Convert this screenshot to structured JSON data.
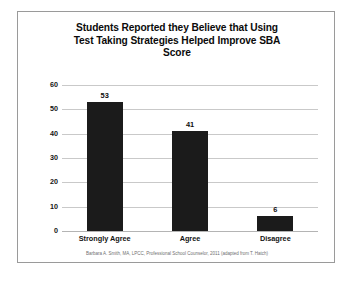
{
  "chart_data": {
    "type": "bar",
    "title": "Students Reported they Believe that Using Test Taking Strategies Helped Improve SBA Score",
    "title_lines": [
      "Students Reported they Believe that Using",
      "Test Taking Strategies Helped Improve SBA",
      "Score"
    ],
    "categories": [
      "Strongly Agree",
      "Agree",
      "Disagree"
    ],
    "values": [
      53,
      41,
      6
    ],
    "xlabel": "",
    "ylabel": "",
    "ylim": [
      0,
      60
    ],
    "yticks": [
      0,
      10,
      20,
      30,
      40,
      50,
      60
    ],
    "ytick_labels": [
      "0",
      "10",
      "20",
      "30",
      "40",
      "50",
      "60"
    ],
    "grid": true,
    "legend": false,
    "data_labels": [
      "53",
      "41",
      "6"
    ],
    "bar_color": "#1b1b1b",
    "gridline_color": "#c9c9c9",
    "text_color": "#141414"
  },
  "footnote": {
    "text": "Barbara A. Smith, MA, LPCC, Professional School Counselor, 2011 (adapted from T. Hatch)",
    "color": "#6f6f6f"
  },
  "frame": {
    "border_color": "#9a9a9a",
    "background": "#ffffff"
  }
}
